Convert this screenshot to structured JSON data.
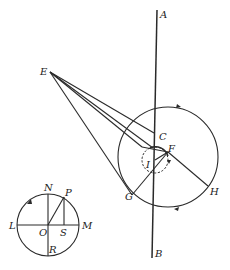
{
  "diagram": {
    "stroke_color": "#2a2a2a",
    "background": "#ffffff",
    "labels": {
      "A": "A",
      "B": "B",
      "C": "C",
      "E": "E",
      "F": "F",
      "G": "G",
      "H": "H",
      "I": "I",
      "N": "N",
      "P": "P",
      "L": "L",
      "O": "O",
      "S": "S",
      "M": "M",
      "R": "R"
    },
    "main_figure": {
      "axis_line": {
        "from": "A",
        "to": "B"
      },
      "large_circle": {
        "direction_arrows": 2,
        "passes_through": [
          "G",
          "H"
        ]
      },
      "small_dashed_circle": {
        "center": "I",
        "passes_through": [
          "F"
        ]
      },
      "lines_from_E": 4,
      "chord": {
        "from": "G",
        "to": "H",
        "through": "F"
      }
    },
    "reference_circle": {
      "center": "O",
      "horizontal_diameter": [
        "L",
        "M"
      ],
      "vertical_diameter": [
        "N",
        "R"
      ],
      "radius_to": "P",
      "perpendicular_foot": "S",
      "direction_arrow": "counterclockwise"
    }
  }
}
